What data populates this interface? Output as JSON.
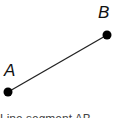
{
  "diagram": {
    "points": [
      {
        "label": "A",
        "x": 8,
        "y": 92
      },
      {
        "label": "B",
        "x": 107,
        "y": 35
      }
    ],
    "segment": {
      "from": "A",
      "to": "B",
      "color": "#222222"
    },
    "caption_partial": "Line segment AB"
  }
}
